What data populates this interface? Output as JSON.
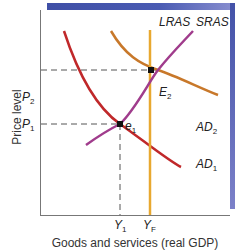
{
  "diagram": {
    "axes": {
      "y_label": "Price level",
      "x_label": "Goods and services (real GDP)"
    },
    "curves": [
      {
        "name": "LRAS",
        "label": "LRAS",
        "color": "#e8a830",
        "type": "vertical"
      },
      {
        "name": "SRAS",
        "label": "SRAS",
        "color": "#a03c8c",
        "type": "upward"
      },
      {
        "name": "AD1",
        "label": "AD",
        "sub": "1",
        "color": "#c0282a",
        "type": "downward"
      },
      {
        "name": "AD2",
        "label": "AD",
        "sub": "2",
        "color": "#c8782a",
        "type": "downward"
      }
    ],
    "points": [
      {
        "name": "e1",
        "label": "e",
        "sub": "1"
      },
      {
        "name": "E2",
        "label": "E",
        "sub": "2"
      }
    ],
    "price_ticks": [
      {
        "label": "P",
        "sub": "2"
      },
      {
        "label": "P",
        "sub": "1"
      }
    ],
    "output_ticks": [
      {
        "label": "Y",
        "sub": "1"
      },
      {
        "label": "Y",
        "sub": "F"
      }
    ],
    "colors": {
      "frame_shadow": "#4352a8",
      "axis": "#777777",
      "dashed_guides": "#555555"
    }
  }
}
